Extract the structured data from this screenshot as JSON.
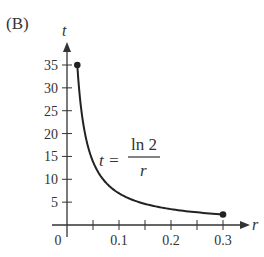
{
  "panel_label": "(B)",
  "chart_data": {
    "type": "line",
    "title": "",
    "xlabel": "r",
    "ylabel": "t",
    "equation": {
      "lhs": "t =",
      "numerator": "ln 2",
      "denominator": "r"
    },
    "xlim": [
      0,
      0.32
    ],
    "ylim": [
      0,
      38
    ],
    "x_ticks": [
      0.05,
      0.1,
      0.15,
      0.2,
      0.25,
      0.3
    ],
    "x_tick_labels": [
      "0",
      "0.1",
      "0.2",
      "0.3"
    ],
    "y_ticks": [
      5,
      10,
      15,
      20,
      25,
      30,
      35
    ],
    "y_tick_labels": [
      "5",
      "10",
      "15",
      "20",
      "25",
      "30",
      "35"
    ],
    "grid": false,
    "series": [
      {
        "name": "t = ln 2 / r",
        "x": [
          0.0198,
          0.025,
          0.03,
          0.04,
          0.05,
          0.07,
          0.1,
          0.15,
          0.2,
          0.25,
          0.3
        ],
        "values": [
          35.0,
          27.7,
          23.1,
          17.3,
          13.9,
          9.9,
          6.9,
          4.6,
          3.5,
          2.8,
          2.3
        ]
      }
    ],
    "endpoints": [
      {
        "x": 0.0198,
        "y": 35.0
      },
      {
        "x": 0.3,
        "y": 2.31
      }
    ]
  }
}
